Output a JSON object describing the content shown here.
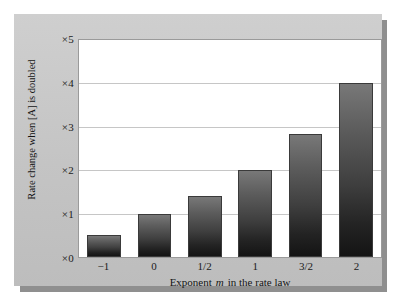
{
  "chart_data": {
    "type": "bar",
    "title": "",
    "subtitle": "",
    "xlabel_prefix": "Exponent",
    "xlabel_variable": "m",
    "xlabel_suffix": "in the rate law",
    "xlabel_full": "Exponent m in the rate law",
    "ylabel": "Rate change when [A] is doubled",
    "categories": [
      "−1",
      "0",
      "1/2",
      "1",
      "3/2",
      "2"
    ],
    "values": [
      0.5,
      1.0,
      1.41,
      2.0,
      2.83,
      4.0
    ],
    "value_formula": "2^m",
    "ylim": [
      0,
      5
    ],
    "ytick_values": [
      0,
      1,
      2,
      3,
      4,
      5
    ],
    "ytick_labels": [
      "×0",
      "×1",
      "×2",
      "×3",
      "×4",
      "×5"
    ],
    "grid": true,
    "grid_axis": "y",
    "legend": false,
    "legend_position": "none",
    "bar_color_top": "#787878",
    "bar_color_bottom": "#141414",
    "bar_edge_color": "#3a3a3a",
    "plot_background": "#ffffff",
    "panel_background": "#c9c9c9",
    "gridline_color": "#c6c6c6",
    "text_color": "#1b1b1b"
  }
}
